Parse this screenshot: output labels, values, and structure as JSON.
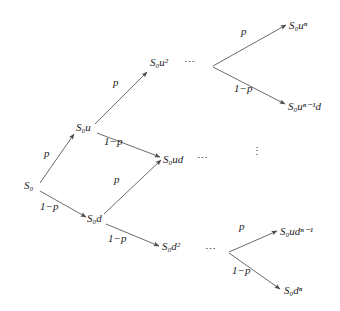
{
  "figure": {
    "type": "binomial-tree-diagram",
    "title": "",
    "stroke_color": "#555555",
    "text_color": "#1c1c1c",
    "background_color": "#ffffff"
  },
  "nodes": {
    "root": {
      "label": "S",
      "sub": "0",
      "sup": "",
      "x": 24,
      "y": 186
    },
    "up1": {
      "label": "S",
      "sub": "0",
      "sup": "",
      "x": 79,
      "y": 129,
      "suffix": "u"
    },
    "down1": {
      "label": "S",
      "sub": "0",
      "sup": "",
      "x": 89,
      "y": 220,
      "suffix": "d"
    },
    "up2": {
      "label": "S",
      "sub": "0",
      "sup": "2",
      "x": 152,
      "y": 65,
      "suffix": "u"
    },
    "ud": {
      "label": "S",
      "sub": "0",
      "sup": "",
      "x": 164,
      "y": 161,
      "suffix": "ud"
    },
    "down2": {
      "label": "S",
      "sub": "0",
      "sup": "2",
      "x": 164,
      "y": 249,
      "suffix": "d"
    },
    "un": {
      "label": "S",
      "sub": "0",
      "sup": "n",
      "x": 291,
      "y": 27,
      "suffix": "u"
    },
    "un1d": {
      "label": "S",
      "sub": "0",
      "sup": "n−1",
      "x": 291,
      "y": 108,
      "suffix": "u",
      "tail": "d"
    },
    "udn1": {
      "label": "S",
      "sub": "0",
      "sup": "n−1",
      "x": 282,
      "y": 233,
      "suffix": "ud"
    },
    "dn": {
      "label": "S",
      "sub": "0",
      "sup": "n",
      "x": 285,
      "y": 292,
      "suffix": "d"
    }
  },
  "node_texts": {
    "root": "S₀",
    "up1": "S₀u",
    "down1": "S₀d",
    "up2": "S₀u²",
    "ud": "S₀ud",
    "down2": "S₀d²",
    "un": "S₀uⁿ",
    "un1d": "S₀uⁿ⁻¹d",
    "udn1": "S₀udⁿ⁻¹",
    "dn": "S₀dⁿ"
  },
  "edges": [
    {
      "name": "root-to-up1",
      "from": [
        40,
        183
      ],
      "to": [
        74,
        134
      ],
      "prob": "p"
    },
    {
      "name": "root-to-down1",
      "from": [
        40,
        191
      ],
      "to": [
        86,
        217
      ],
      "prob": "1−p"
    },
    {
      "name": "up1-to-up2",
      "from": [
        95,
        124
      ],
      "to": [
        147,
        72
      ],
      "prob": "p"
    },
    {
      "name": "up1-to-ud",
      "from": [
        97,
        133
      ],
      "to": [
        160,
        157
      ],
      "prob": "1−p"
    },
    {
      "name": "down1-to-ud",
      "from": [
        104,
        214
      ],
      "to": [
        161,
        160
      ],
      "prob": "p"
    },
    {
      "name": "down1-to-down2",
      "from": [
        106,
        224
      ],
      "to": [
        159,
        246
      ],
      "prob": "1−p"
    },
    {
      "name": "vertexTop-to-un",
      "from": [
        213,
        66
      ],
      "to": [
        286,
        25
      ],
      "prob": "p"
    },
    {
      "name": "vertexTop-to-un1d",
      "from": [
        213,
        67
      ],
      "to": [
        285,
        104
      ],
      "prob": "1−p"
    },
    {
      "name": "vertexBot-to-udn1",
      "from": [
        229,
        252
      ],
      "to": [
        277,
        231
      ],
      "prob": "p"
    },
    {
      "name": "vertexBot-to-dn",
      "from": [
        229,
        253
      ],
      "to": [
        280,
        289
      ],
      "prob": "1−p"
    }
  ],
  "probability_labels": [
    {
      "name": "p-root-up",
      "text": "p",
      "x": 44,
      "y": 154
    },
    {
      "name": "one-minus-p-root-down",
      "text": "1−p",
      "x": 42,
      "y": 207
    },
    {
      "name": "p-up1-up2",
      "text": "p",
      "x": 113,
      "y": 83
    },
    {
      "name": "one-minus-p-up1-ud",
      "text": "1−p",
      "x": 106,
      "y": 142
    },
    {
      "name": "p-down1-ud",
      "text": "p",
      "x": 114,
      "y": 180
    },
    {
      "name": "one-minus-p-down1-down2",
      "text": "1−p",
      "x": 110,
      "y": 239
    },
    {
      "name": "p-top-un",
      "text": "p",
      "x": 241,
      "y": 32
    },
    {
      "name": "one-minus-p-top-un1d",
      "text": "1−p",
      "x": 236,
      "y": 89
    },
    {
      "name": "p-bot-udn1",
      "text": "p",
      "x": 239,
      "y": 227
    },
    {
      "name": "one-minus-p-bot-dn",
      "text": "1−p",
      "x": 234,
      "y": 271
    }
  ],
  "ellipses": [
    {
      "name": "ellipsis-top",
      "text": "⋯",
      "x": 184,
      "y": 59,
      "orientation": "horizontal"
    },
    {
      "name": "ellipsis-middle",
      "text": "⋯",
      "x": 197,
      "y": 155,
      "orientation": "horizontal"
    },
    {
      "name": "ellipsis-bottom",
      "text": "⋯",
      "x": 205,
      "y": 246,
      "orientation": "horizontal"
    },
    {
      "name": "ellipsis-vertical",
      "text": "⋮",
      "x": 252,
      "y": 150,
      "orientation": "vertical"
    }
  ]
}
